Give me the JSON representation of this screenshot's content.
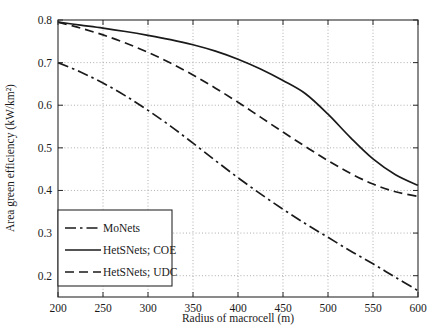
{
  "chart_data": {
    "type": "line",
    "title": "",
    "xlabel": "Radius of macrocell (m)",
    "ylabel": "Area green efficiency (kW/km²)",
    "xlim": [
      200,
      600
    ],
    "ylim": [
      0.15,
      0.8
    ],
    "xticks": [
      200,
      250,
      300,
      350,
      400,
      450,
      500,
      550,
      600
    ],
    "xtick_labels": [
      "200",
      "250",
      "300",
      "350",
      "400",
      "450",
      "500",
      "550",
      "600"
    ],
    "yticks": [
      0.2,
      0.3,
      0.4,
      0.5,
      0.6,
      0.7,
      0.8
    ],
    "ytick_labels": [
      "0.2",
      "0.3",
      "0.4",
      "0.5",
      "0.6",
      "0.7",
      "0.8"
    ],
    "grid": true,
    "grid_style": "dotted",
    "legend_position": "lower-left",
    "x": [
      200,
      225,
      250,
      275,
      300,
      325,
      350,
      375,
      400,
      425,
      450,
      475,
      500,
      525,
      550,
      575,
      600
    ],
    "series": [
      {
        "name": "MoNets",
        "style": "dashdot",
        "color": "#1a1a1a",
        "values": [
          0.7,
          0.678,
          0.652,
          0.622,
          0.588,
          0.551,
          0.511,
          0.47,
          0.43,
          0.392,
          0.356,
          0.322,
          0.29,
          0.258,
          0.228,
          0.196,
          0.165
        ]
      },
      {
        "name": "HetSNets; COE",
        "style": "solid",
        "color": "#1a1a1a",
        "values": [
          0.795,
          0.788,
          0.781,
          0.773,
          0.764,
          0.754,
          0.742,
          0.727,
          0.708,
          0.685,
          0.658,
          0.627,
          0.579,
          0.524,
          0.474,
          0.437,
          0.412
        ]
      },
      {
        "name": "HetSNets; UDC",
        "style": "dashed",
        "color": "#1a1a1a",
        "values": [
          0.795,
          0.781,
          0.765,
          0.746,
          0.724,
          0.699,
          0.671,
          0.64,
          0.607,
          0.572,
          0.537,
          0.503,
          0.47,
          0.44,
          0.415,
          0.397,
          0.386
        ]
      }
    ]
  },
  "legend": {
    "entries": [
      {
        "label": "MoNets",
        "style": "dashdot"
      },
      {
        "label": "HetSNets; COE",
        "style": "solid"
      },
      {
        "label": "HetSNets; UDC",
        "style": "dashed"
      }
    ]
  }
}
